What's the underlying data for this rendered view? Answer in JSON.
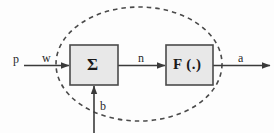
{
  "diagram": {
    "colors": {
      "background": "#fdfdfd",
      "stroke": "#3a3a3a",
      "box_fill": "#e8e8e8",
      "box_border": "#4a4a4a",
      "dashed_boundary": "#4a4a4a",
      "text": "#1f1f1f"
    },
    "boundary": {
      "name": "neuron-boundary",
      "shape": "ellipse",
      "style": "dashed",
      "cx": 139,
      "cy": 64,
      "rx": 83,
      "ry": 57
    },
    "blocks": [
      {
        "id": "summation",
        "label": "Σ",
        "x": 70,
        "y": 45,
        "width": 48,
        "height": 40
      },
      {
        "id": "transfer-function",
        "label": "F (.)",
        "x": 166,
        "y": 45,
        "width": 47,
        "height": 40
      }
    ],
    "signals": [
      {
        "id": "input",
        "label": "p",
        "x": 13,
        "y": 53
      },
      {
        "id": "weight",
        "label": "w",
        "x": 42,
        "y": 52
      },
      {
        "id": "net",
        "label": "n",
        "x": 138,
        "y": 52
      },
      {
        "id": "bias",
        "label": "b",
        "x": 100,
        "y": 100
      },
      {
        "id": "output",
        "label": "a",
        "x": 238,
        "y": 52
      }
    ],
    "arrows": [
      {
        "id": "input-to-sum",
        "from": "p",
        "to": "summation"
      },
      {
        "id": "sum-to-fn",
        "from": "Σ",
        "to": "transfer-function"
      },
      {
        "id": "fn-to-output",
        "from": "F (.)",
        "to": "a"
      },
      {
        "id": "bias-to-sum",
        "from": "b",
        "to": "summation"
      }
    ]
  }
}
